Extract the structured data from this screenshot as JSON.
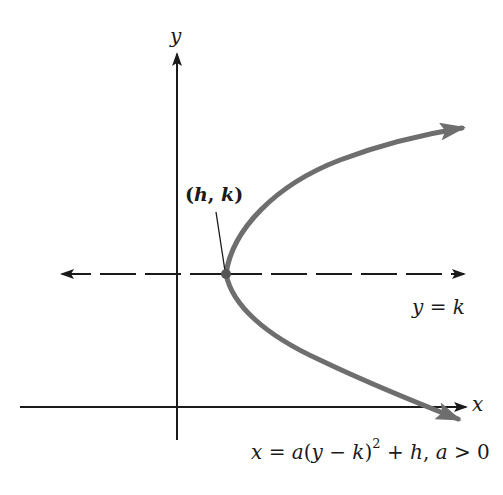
{
  "figure": {
    "type": "parabola-diagram",
    "colors": {
      "axes": "#1a1a1a",
      "curve": "#6e6e6e",
      "dashed_line": "#1a1a1a",
      "vertex_point": "#555555",
      "background": "#ffffff"
    }
  },
  "axes": {
    "x_label": "x",
    "y_label": "y"
  },
  "vertex": {
    "label_open": "(",
    "label_h": "h",
    "label_sep": ", ",
    "label_k": "k",
    "label_close": ")"
  },
  "axis_of_symmetry": {
    "label_var": "y",
    "label_eq": " = ",
    "label_val": "k",
    "style": "dashed"
  },
  "equation": {
    "lhs": "x",
    "eq": " = ",
    "a": "a",
    "open": "(",
    "y": "y",
    "minus": " − ",
    "k": "k",
    "close": ")",
    "exponent": "2",
    "plus": " + ",
    "h": "h",
    "comma": ", ",
    "a2": "a",
    "condition": " > 0"
  }
}
